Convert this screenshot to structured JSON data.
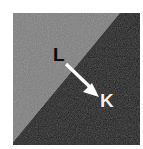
{
  "figure": {
    "caption_text": "",
    "panel": {
      "width_px": 127,
      "height_px": 132,
      "margin_px": 13,
      "background_color": "#ffffff"
    },
    "regions": [
      {
        "id": "region-L",
        "label": "L",
        "position": "upper-left",
        "fill_color": "#7d7d7d",
        "label_color": "#0a0a0a",
        "description": "light grey phase"
      },
      {
        "id": "region-K",
        "label": "K",
        "position": "lower-right",
        "fill_color": "#121212",
        "label_color": "#f2f2f2",
        "description": "dark phase"
      }
    ],
    "boundary": {
      "name": "interface-line",
      "type": "diagonal",
      "from": "top-right",
      "to": "bottom-left",
      "color": "#121212"
    },
    "annotations": [
      {
        "id": "pointer-arrow",
        "type": "arrow",
        "color": "#ffffff",
        "points_from": "L",
        "points_to": "K",
        "direction": "down-right"
      }
    ]
  }
}
